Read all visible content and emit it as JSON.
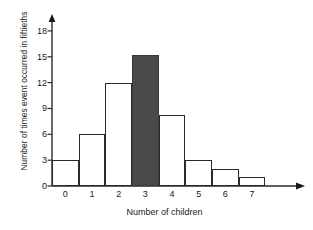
{
  "chart_data": {
    "type": "bar",
    "title": "",
    "xlabel": "Number of children",
    "ylabel": "Number of times event occurred in fiftieths",
    "categories": [
      "0",
      "1",
      "2",
      "3",
      "4",
      "5",
      "6",
      "7"
    ],
    "values": [
      3,
      6,
      12,
      15.2,
      8.3,
      3,
      2,
      1
    ],
    "highlight_index": 3,
    "highlight_color": "#4a4a4a",
    "bar_color": "#ffffff",
    "bar_edge_color": "#2b2b2b",
    "ylim": [
      0,
      19.5
    ],
    "yticks": [
      "0",
      "3",
      "6",
      "9",
      "12",
      "15",
      "18"
    ],
    "ytick_values": [
      0,
      3,
      6,
      9,
      12,
      15,
      18
    ],
    "grid": false,
    "legend": false,
    "axis_arrows": true
  }
}
